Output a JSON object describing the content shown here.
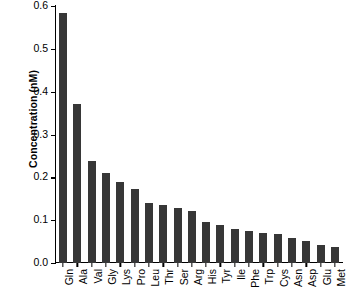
{
  "chart_data": {
    "type": "bar",
    "title": "",
    "xlabel": "",
    "ylabel": "Concentration (nM)",
    "ylim": [
      0.0,
      0.6
    ],
    "ytick_labels": [
      "0.0",
      "0.1",
      "0.2",
      "0.3",
      "0.4",
      "0.5",
      "0.6"
    ],
    "ytick_values": [
      0.0,
      0.1,
      0.2,
      0.3,
      0.4,
      0.5,
      0.6
    ],
    "grid": false,
    "legend": null,
    "bar_color": "#373737",
    "axis_color": "#000000",
    "categories": [
      "Gln",
      "Ala",
      "Val",
      "Gly",
      "Lys",
      "Pro",
      "Leu",
      "Thr",
      "Ser",
      "Arg",
      "His",
      "Tyr",
      "Ile",
      "Phe",
      "Trp",
      "Cys",
      "Asn",
      "Asp",
      "Glu",
      "Met"
    ],
    "values": [
      0.583,
      0.372,
      0.239,
      0.209,
      0.19,
      0.172,
      0.139,
      0.135,
      0.128,
      0.122,
      0.095,
      0.088,
      0.08,
      0.074,
      0.07,
      0.068,
      0.058,
      0.051,
      0.043,
      0.037
    ]
  }
}
